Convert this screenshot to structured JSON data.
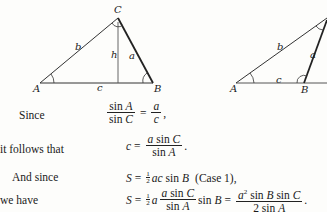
{
  "figures": {
    "left_triangle": {
      "vertices": {
        "A": "A",
        "B": "B",
        "C": "C"
      },
      "sides": {
        "a": "a",
        "b": "b",
        "c": "c"
      },
      "altitude": "h"
    },
    "right_triangle": {
      "vertices": {
        "A": "A",
        "B": "B"
      },
      "sides": {
        "a": "a",
        "b": "b",
        "c": "c"
      }
    }
  },
  "lines": [
    {
      "lead": "Since",
      "sinA": "sin",
      "A": "A",
      "sinC": "sin",
      "C": "C",
      "eq": "=",
      "a": "a",
      "c": "c",
      "tail": ","
    },
    {
      "lead": "it follows that",
      "c": "c",
      "eq": "=",
      "a": "a",
      "sin": "sin",
      "C": "C",
      "sin2": "sin",
      "A": "A",
      "tail": "."
    },
    {
      "lead": "And since",
      "S": "S",
      "eq": "=",
      "half_n": "1",
      "half_d": "2",
      "ac": "ac",
      "sin": "sin",
      "B": "B",
      "note": "(Case 1),"
    },
    {
      "lead": "we have",
      "S": "S",
      "eq": "=",
      "half_n": "1",
      "half_d": "2",
      "a": "a",
      "num_a": "a",
      "sin": "sin",
      "C": "C",
      "den_sin": "sin",
      "A": "A",
      "sinB": "sin",
      "B": "B",
      "eq2": "=",
      "a2": "a",
      "exp": "2",
      "sB": "sin",
      "Bv": "B",
      "sC": "sin",
      "Cv": "C",
      "den2": "2 sin",
      "A2": "A",
      "tail": "."
    }
  ]
}
